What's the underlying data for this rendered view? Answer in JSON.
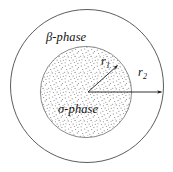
{
  "figure": {
    "kind": "concentric-circle-diagram",
    "width": 173,
    "height": 172,
    "background_color": "#ffffff",
    "stroke_color": "#3d3d3d",
    "stipple_color": "#8c8c8c",
    "text_color": "#111111",
    "outer_region": {
      "name": "beta-phase",
      "label": "β-phase",
      "fill": "white",
      "center_x": 87,
      "center_y": 86,
      "radius": 77
    },
    "inner_region": {
      "name": "sigma-phase",
      "label": "σ-phase",
      "fill": "stipple",
      "center_x": 86,
      "center_y": 92,
      "radius": 46
    },
    "radii": [
      {
        "name": "inner-radius",
        "symbol": "r",
        "subscript": "1",
        "label": "r1",
        "from_x": 88,
        "from_y": 92,
        "to_x": 119,
        "to_y": 64
      },
      {
        "name": "outer-radius",
        "symbol": "r",
        "subscript": "2",
        "label": "r2",
        "from_x": 88,
        "from_y": 92,
        "to_x": 163,
        "to_y": 92
      }
    ]
  }
}
